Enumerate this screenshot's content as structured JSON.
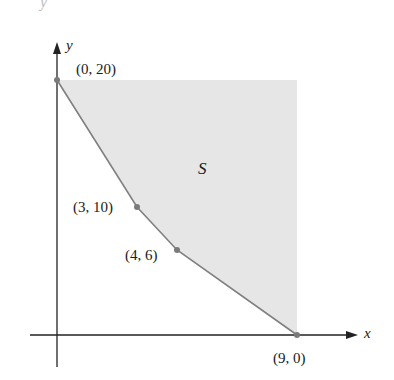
{
  "diagram": {
    "type": "feasible-region",
    "axes": {
      "x_label": "x",
      "y_label": "y"
    },
    "region_label": "S",
    "vertices": [
      {
        "label": "(0, 20)",
        "x": 0,
        "y": 20
      },
      {
        "label": "(3, 10)",
        "x": 3,
        "y": 10
      },
      {
        "label": "(4, 6)",
        "x": 4,
        "y": 6
      },
      {
        "label": "(9, 0)",
        "x": 9,
        "y": 0
      }
    ],
    "colors": {
      "region_fill": "#e6e6e6",
      "boundary": "#808080",
      "vertex_dot": "#7a7a7a",
      "axis": "#222222"
    }
  },
  "bleed_through": {
    "top_fragment": "y",
    "right_fragments": [
      "intersect",
      "problems",
      "offset",
      "more",
      "cost is",
      "ity",
      "al we",
      "nding",
      "the",
      "d the",
      "n the",
      "tended",
      "ts in",
      "when the"
    ]
  }
}
